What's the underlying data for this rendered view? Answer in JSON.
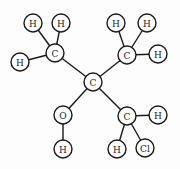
{
  "diagram": {
    "type": "molecular-structure",
    "atoms": [
      {
        "id": "c_center",
        "label": "C",
        "x": 93,
        "y": 82,
        "r": 9
      },
      {
        "id": "c_ul",
        "label": "C",
        "x": 55,
        "y": 53,
        "r": 9
      },
      {
        "id": "h_ul_1",
        "label": "H",
        "x": 33,
        "y": 23,
        "r": 9
      },
      {
        "id": "h_ul_2",
        "label": "H",
        "x": 61,
        "y": 23,
        "r": 9
      },
      {
        "id": "h_ul_3",
        "label": "H",
        "x": 20,
        "y": 62,
        "r": 9
      },
      {
        "id": "c_ur",
        "label": "C",
        "x": 127,
        "y": 55,
        "r": 9
      },
      {
        "id": "h_ur_1",
        "label": "H",
        "x": 116,
        "y": 23,
        "r": 9
      },
      {
        "id": "h_ur_2",
        "label": "H",
        "x": 147,
        "y": 23,
        "r": 9
      },
      {
        "id": "h_ur_3",
        "label": "H",
        "x": 158,
        "y": 54,
        "r": 9
      },
      {
        "id": "o",
        "label": "O",
        "x": 63,
        "y": 115,
        "r": 9
      },
      {
        "id": "h_o",
        "label": "H",
        "x": 63,
        "y": 149,
        "r": 9
      },
      {
        "id": "c_lr",
        "label": "C",
        "x": 127,
        "y": 116,
        "r": 9
      },
      {
        "id": "h_lr_1",
        "label": "H",
        "x": 158,
        "y": 115,
        "r": 9
      },
      {
        "id": "h_lr_2",
        "label": "H",
        "x": 117,
        "y": 149,
        "r": 9
      },
      {
        "id": "cl",
        "label": "Cl",
        "x": 145,
        "y": 148,
        "r": 9
      }
    ],
    "bonds": [
      [
        "c_center",
        "c_ul"
      ],
      [
        "c_center",
        "c_ur"
      ],
      [
        "c_center",
        "o"
      ],
      [
        "c_center",
        "c_lr"
      ],
      [
        "c_ul",
        "h_ul_1"
      ],
      [
        "c_ul",
        "h_ul_2"
      ],
      [
        "c_ul",
        "h_ul_3"
      ],
      [
        "c_ur",
        "h_ur_1"
      ],
      [
        "c_ur",
        "h_ur_2"
      ],
      [
        "c_ur",
        "h_ur_3"
      ],
      [
        "o",
        "h_o"
      ],
      [
        "c_lr",
        "h_lr_1"
      ],
      [
        "c_lr",
        "h_lr_2"
      ],
      [
        "c_lr",
        "cl"
      ]
    ]
  }
}
